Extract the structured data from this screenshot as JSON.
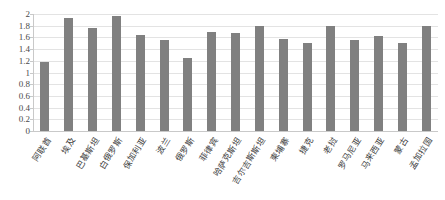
{
  "header": {
    "clipped_text": ""
  },
  "chart_data": {
    "type": "bar",
    "title": "",
    "subtitle": "",
    "xlabel": "",
    "ylabel": "",
    "ylim": [
      0,
      2
    ],
    "ytick_labels": [
      "2",
      "1.8",
      "1.6",
      "1.4",
      "1.2",
      "1",
      "0.8",
      "0.6",
      "0.4",
      "0.2",
      "0"
    ],
    "ytick_values": [
      2,
      1.8,
      1.6,
      1.4,
      1.2,
      1,
      0.8,
      0.6,
      0.4,
      0.2,
      0
    ],
    "grid": true,
    "legend": "none",
    "bar_color": "#808080",
    "gridline_color": "#e3e3e3",
    "axis_color": "#c9c9c9",
    "categories": [
      "阿联酋",
      "埃及",
      "巴基斯坦",
      "白俄罗斯",
      "保加利亚",
      "波兰",
      "俄罗斯",
      "菲律宾",
      "哈萨克斯坦",
      "吉尔吉斯斯坦",
      "柬埔寨",
      "捷克",
      "老挝",
      "罗马尼亚",
      "马来西亚",
      "蒙古",
      "孟加拉国"
    ],
    "values": [
      1.18,
      1.94,
      1.76,
      1.97,
      1.64,
      1.56,
      1.25,
      1.7,
      1.67,
      1.79,
      1.57,
      1.51,
      1.79,
      1.55,
      1.62,
      1.51,
      1.79
    ]
  }
}
